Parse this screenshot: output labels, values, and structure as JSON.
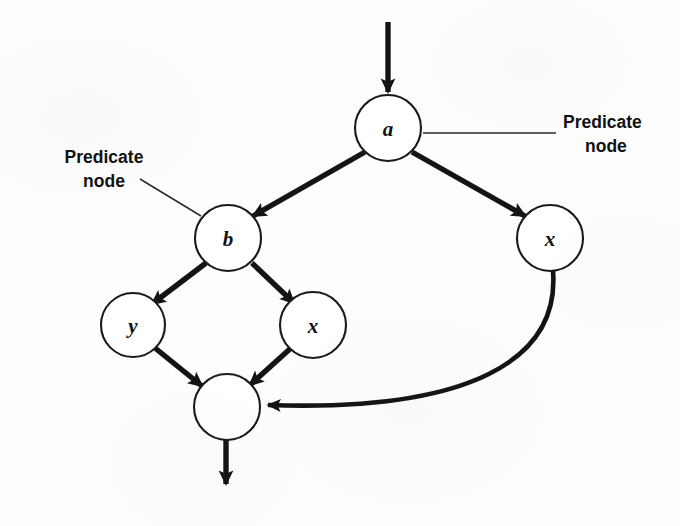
{
  "figure": {
    "kind": "control-flow-graph",
    "background_color": "#fdfdfd",
    "ink_color": "#141414"
  },
  "nodes": [
    {
      "id": "a",
      "label": "a",
      "cx": 388,
      "cy": 128,
      "r": 33,
      "kind": "predicate"
    },
    {
      "id": "b",
      "label": "b",
      "cx": 228,
      "cy": 238,
      "r": 33,
      "kind": "predicate"
    },
    {
      "id": "x_right",
      "label": "x",
      "cx": 550,
      "cy": 238,
      "r": 33,
      "kind": "statement"
    },
    {
      "id": "y",
      "label": "y",
      "cx": 133,
      "cy": 325,
      "r": 32,
      "kind": "statement"
    },
    {
      "id": "x_low",
      "label": "x",
      "cx": 313,
      "cy": 325,
      "r": 33,
      "kind": "statement"
    },
    {
      "id": "merge",
      "label": "",
      "cx": 227,
      "cy": 407,
      "r": 33,
      "kind": "merge"
    }
  ],
  "edges": [
    {
      "id": "entry",
      "from": "",
      "to": "a",
      "style": "straight",
      "arrow": true
    },
    {
      "id": "a-to-b",
      "from": "a",
      "to": "b",
      "style": "straight",
      "arrow": true
    },
    {
      "id": "a-to-x",
      "from": "a",
      "to": "x_right",
      "style": "straight",
      "arrow": true
    },
    {
      "id": "b-to-y",
      "from": "b",
      "to": "y",
      "style": "straight",
      "arrow": true
    },
    {
      "id": "b-to-x",
      "from": "b",
      "to": "x_low",
      "style": "straight",
      "arrow": true
    },
    {
      "id": "y-to-merge",
      "from": "y",
      "to": "merge",
      "style": "straight",
      "arrow": true
    },
    {
      "id": "x-to-merge",
      "from": "x_low",
      "to": "merge",
      "style": "straight",
      "arrow": true
    },
    {
      "id": "xright-to-merge",
      "from": "x_right",
      "to": "merge",
      "style": "curved",
      "arrow": true
    },
    {
      "id": "exit",
      "from": "merge",
      "to": "",
      "style": "straight",
      "arrow": true
    }
  ],
  "annotations": {
    "right_label": {
      "line1": "Predicate",
      "line2": "node",
      "target_node": "a"
    },
    "left_label": {
      "line1": "Predicate",
      "line2": "node",
      "target_node": "b"
    }
  }
}
